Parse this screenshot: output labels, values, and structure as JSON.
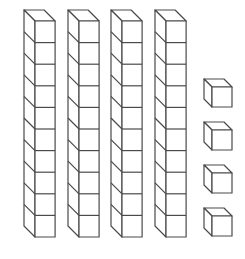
{
  "diagram": {
    "stroke_color": "#4a4a4a",
    "fill_color": "#ffffff",
    "tens_rods": {
      "count": 4,
      "cubes_per_rod": 10,
      "front_x": [
        35,
        79,
        122,
        166
      ],
      "front_top_y": 21,
      "cube_size": 21.6,
      "depth_dx": -11,
      "depth_dy": -11
    },
    "unit_cubes": {
      "count": 4,
      "front_x": 212,
      "front_y": [
        87,
        130,
        173,
        216
      ],
      "cube_size": 20,
      "depth_dx": -8,
      "depth_dy": -8
    },
    "represented_value": 44
  }
}
